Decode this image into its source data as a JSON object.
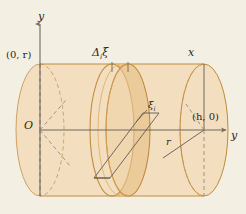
{
  "figure": {
    "kind": "cylinder-tank-slab-diagram",
    "background_color": "#f4efe3",
    "body_fill_color": "#f3dfc0",
    "slab_fill_color": "#e8c188",
    "outline_color": "#c08b3e",
    "axis_color": "#6f6a62",
    "construction_color": "#5f5a52",
    "label_color": "#2b2722"
  },
  "labels": {
    "y_axis_top": "y",
    "x_axis": "x",
    "y_axis_right": "y",
    "origin": "O",
    "point_top_left": "(0, r)",
    "point_right": "(h, 0)",
    "slab_thickness": "Δ",
    "slab_thickness_sub": "i",
    "slab_thickness_var": "ξ",
    "sample_point": "ξ",
    "sample_point_sub": "i",
    "radius": "r"
  },
  "geometry": {
    "axis_vertical_x": 40,
    "axis_vertical_top_y": 22,
    "axis_horizontal_y": 130,
    "axis_horizontal_right_x": 228,
    "origin_x": 40,
    "origin_y": 130,
    "ellipse_rx": 24,
    "ellipse_ry": 66,
    "left_face_cx": 40,
    "right_face_cx": 204,
    "slab_front_cx": 128,
    "slab_back_cx": 112,
    "top_edge_y": 64,
    "bottom_edge_y": 196
  }
}
